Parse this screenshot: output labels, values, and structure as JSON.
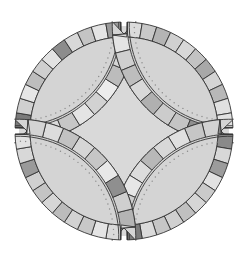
{
  "figure": {
    "background": "#ffffff",
    "center_fill": "#d9d9d9",
    "melon_fill": "#d4d4d4",
    "outline": "#333333",
    "gap": "#ffffff",
    "stitch_color": "#8a8a8a"
  },
  "geometry": {
    "cx": 124,
    "cy": 131,
    "outer_r": 109,
    "band": 15,
    "gap": 3
  },
  "quadrants": [
    {
      "name": "top-left",
      "outer": [
        "#7a7a7a",
        "#d0d0d0",
        "#e6e6e6",
        "#bdbdbd",
        "#cfcfcf",
        "#e2e2e2",
        "#8c8c8c",
        "#d8d8d8",
        "#c4c4c4",
        "#e4e4e4",
        "#9a9a9a"
      ],
      "inner": [
        "#cfcfcf",
        "#dadada",
        "#c6c6c6",
        "#e4e4e4",
        "#d2d2d2",
        "#ececec",
        "#bcbcbc",
        "#d6d6d6",
        "#c8c8c8"
      ]
    },
    {
      "name": "top-right",
      "outer": [
        "#dcdcdc",
        "#c8c8c8",
        "#b4b4b4",
        "#d0d0d0",
        "#d8d8d8",
        "#c2c2c2",
        "#a8a8a8",
        "#d4d4d4",
        "#b8b8b8",
        "#e0e0e0",
        "#e2e2e2"
      ],
      "inner": [
        "#e4e4e4",
        "#cfcfcf",
        "#bdbdbd",
        "#d8d8d8",
        "#b0b0b0",
        "#cccccc",
        "#c4c4c4",
        "#8f8f8f",
        "#d2d2d2"
      ]
    },
    {
      "name": "bottom-right",
      "outer": [
        "#8a8a8a",
        "#d8d8d8",
        "#9c9c9c",
        "#e2e2e2",
        "#cacaca",
        "#d6d6d6",
        "#c0c0c0",
        "#d0d0d0",
        "#c6c6c6",
        "#dadada",
        "#7c7c7c"
      ],
      "inner": [
        "#d2d2d2",
        "#c6c6c6",
        "#e0e0e0",
        "#d8d8d8",
        "#b8b8b8",
        "#dcdcdc",
        "#e6e6e6",
        "#cdcdcd",
        "#c4c4c4"
      ]
    },
    {
      "name": "bottom-left",
      "outer": [
        "#dadada",
        "#e4e4e4",
        "#c8c8c8",
        "#d2d2d2",
        "#bcbcbc",
        "#d6d6d6",
        "#c4c4c4",
        "#d0d0d0",
        "#9a9a9a",
        "#d8d8d8",
        "#e2e2e2"
      ],
      "inner": [
        "#b4b4b4",
        "#cfcfcf",
        "#8f8f8f",
        "#e8e8e8",
        "#c6c6c6",
        "#d6d6d6",
        "#c2c2c2",
        "#dcdcdc",
        "#d4d4d4"
      ]
    }
  ]
}
